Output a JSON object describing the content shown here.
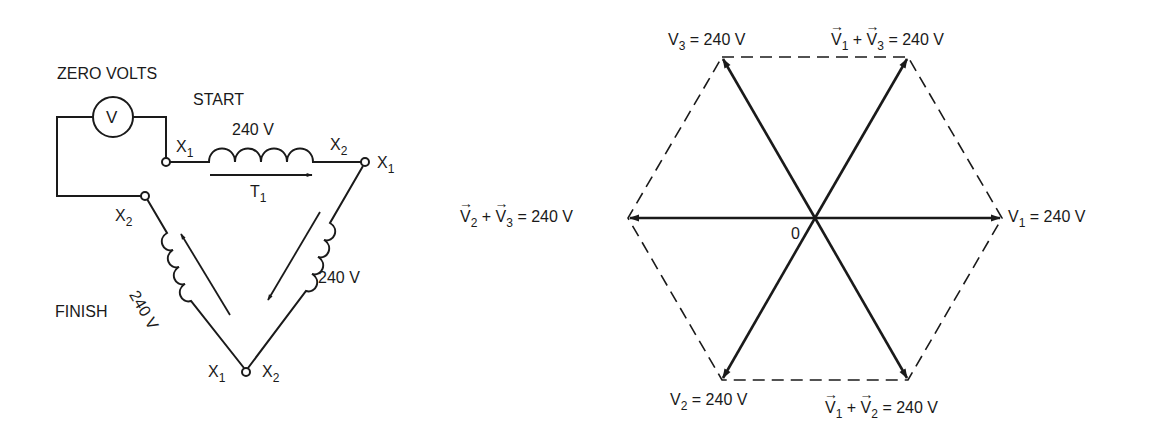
{
  "figure": {
    "left_diagram": {
      "title": "Delta-connected transformer windings with voltmeter",
      "labels": {
        "voltmeter_caption": "ZERO VOLTS",
        "voltmeter_symbol": "V",
        "start": "START",
        "finish": "FINISH",
        "t1": "T",
        "t1_sub": "1",
        "coil_top_voltage": "240 V",
        "coil_right_voltage": "240 V",
        "coil_left_voltage": "240 V",
        "x": "X",
        "sub1": "1",
        "sub2": "2"
      }
    },
    "right_diagram": {
      "title": "Phasor hexagon diagram",
      "origin_label": "0",
      "labels": {
        "v1": {
          "name": "V",
          "sub": "1",
          "value": "= 240 V"
        },
        "v2": {
          "name": "V",
          "sub": "2",
          "value": "= 240 V"
        },
        "v3": {
          "name": "V",
          "sub": "3",
          "value": "= 240 V"
        },
        "v1_plus_v3": {
          "a": "V",
          "a_sub": "1",
          "plus": "+",
          "b": "V",
          "b_sub": "3",
          "value": "= 240 V"
        },
        "v1_plus_v2": {
          "a": "V",
          "a_sub": "1",
          "plus": "+",
          "b": "V",
          "b_sub": "2",
          "value": "= 240 V"
        },
        "v2_plus_v3": {
          "a": "V",
          "a_sub": "2",
          "plus": "+",
          "b": "V",
          "b_sub": "3",
          "value": "= 240 V"
        }
      }
    },
    "colors": {
      "ink": "#1a1a1a",
      "background": "#ffffff"
    }
  }
}
